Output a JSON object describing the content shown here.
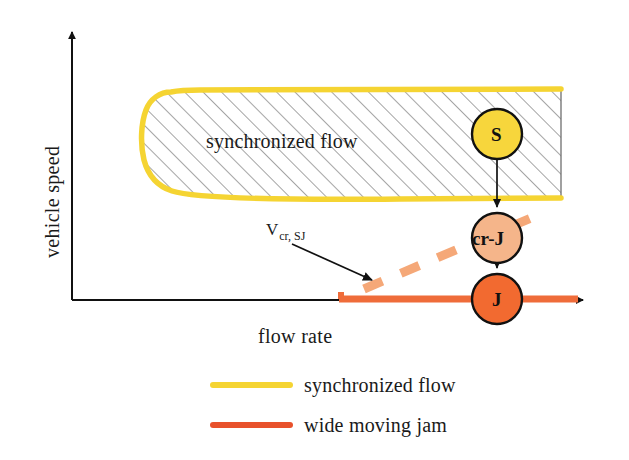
{
  "figure": {
    "type": "diagram",
    "axes": {
      "y_label": "vehicle speed",
      "x_label": "flow rate",
      "y_axis_name": "vehicle-speed-axis",
      "x_axis_name": "flow-rate-axis"
    },
    "region": {
      "label": "synchronized flow",
      "fill": "hatched",
      "border_color": "#F5D432"
    },
    "annotation": {
      "symbol": "V",
      "subscript": "cr, SJ"
    },
    "nodes": [
      {
        "id": "S",
        "label": "S",
        "color": "#F7D63C",
        "stroke": "#111111"
      },
      {
        "id": "cr-J",
        "label": "cr-J",
        "color": "#F5B58A",
        "stroke": "#111111"
      },
      {
        "id": "J",
        "label": "J",
        "color": "#F26A30",
        "stroke": "#111111"
      }
    ],
    "lines": {
      "dashed_transition_color": "#F5A878",
      "wide_moving_jam_color": "#EF6C3A",
      "synchronized_flow_color": "#F5D432"
    },
    "legend": [
      {
        "swatch": "synchronized-flow-swatch",
        "color": "#F5D432",
        "label": "synchronized flow"
      },
      {
        "swatch": "wide-moving-jam-swatch",
        "color": "#E8512B",
        "label": "wide moving jam"
      }
    ]
  },
  "chart_data": {
    "type": "diagram",
    "title": "",
    "xlabel": "flow rate",
    "ylabel": "vehicle speed",
    "grid": false,
    "legend_position": "bottom",
    "annotations": [
      {
        "text": "synchronized flow",
        "role": "region-label"
      },
      {
        "text": "V cr, SJ",
        "role": "critical-speed-label"
      },
      {
        "text": "S",
        "role": "state-node"
      },
      {
        "text": "cr-J",
        "role": "state-node"
      },
      {
        "text": "J",
        "role": "state-node"
      }
    ],
    "series": [
      {
        "name": "synchronized flow",
        "color": "#F5D432",
        "style": "solid-boundary"
      },
      {
        "name": "wide moving jam",
        "color": "#E8512B",
        "style": "solid"
      },
      {
        "name": "critical speed V_cr,SJ",
        "color": "#F5A878",
        "style": "dashed"
      }
    ]
  }
}
